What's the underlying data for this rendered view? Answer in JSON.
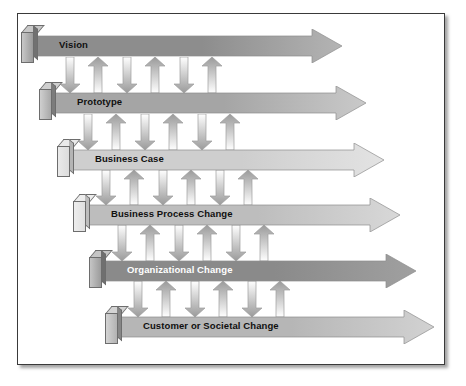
{
  "diagram": {
    "frame": {
      "border_color": "#3a3a3a",
      "background": "#ffffff"
    },
    "rows": [
      {
        "label": "Vision",
        "text_color": "#101010",
        "fill_start": "#8d8d8d",
        "fill_end": "#b4b4b4",
        "cap_front": "#9a9a9a",
        "cap_top": "#c8c8c8",
        "cap_side": "#717171",
        "x": 14,
        "y": 15,
        "width": 310,
        "label_x": 27
      },
      {
        "label": "Prototype",
        "text_color": "#101010",
        "fill_start": "#a5a5a5",
        "fill_end": "#c9c9c9",
        "cap_front": "#a8a8a8",
        "cap_top": "#cfcfcf",
        "cap_side": "#7c7c7c",
        "x": 32,
        "y": 72,
        "width": 316,
        "label_x": 27
      },
      {
        "label": "Business Case",
        "text_color": "#101010",
        "fill_start": "#cecece",
        "fill_end": "#e3e3e3",
        "cap_front": "#dcdcdc",
        "cap_top": "#eaeaea",
        "cap_side": "#b4b4b4",
        "x": 50,
        "y": 129,
        "width": 316,
        "label_x": 27
      },
      {
        "label": "Business Process Change",
        "text_color": "#101010",
        "fill_start": "#bdbdbd",
        "fill_end": "#d8d8d8",
        "cap_front": "#e0e0e0",
        "cap_top": "#ededed",
        "cap_side": "#bdbdbd",
        "x": 66,
        "y": 184,
        "width": 316,
        "label_x": 27
      },
      {
        "label": "Organizational Change",
        "text_color": "#ffffff",
        "fill_start": "#8a8a8a",
        "fill_end": "#a0a0a0",
        "cap_front": "#9b9b9b",
        "cap_top": "#c5c5c5",
        "cap_side": "#6f6f6f",
        "x": 82,
        "y": 240,
        "width": 316,
        "label_x": 27
      },
      {
        "label": "Customer or Societal Change",
        "text_color": "#101010",
        "fill_start": "#b6b6b6",
        "fill_end": "#d2d2d2",
        "cap_front": "#b2b2b2",
        "cap_top": "#d4d4d4",
        "cap_side": "#868686",
        "x": 98,
        "y": 296,
        "width": 318,
        "label_x": 27
      }
    ],
    "connector_gaps": [
      {
        "y": 48,
        "height": 26,
        "start_x": 42,
        "pairs": 3
      },
      {
        "y": 105,
        "height": 26,
        "start_x": 60,
        "pairs": 3
      },
      {
        "y": 161,
        "height": 25,
        "start_x": 78,
        "pairs": 3
      },
      {
        "y": 216,
        "height": 26,
        "start_x": 94,
        "pairs": 3
      },
      {
        "y": 272,
        "height": 26,
        "start_x": 110,
        "pairs": 3
      }
    ],
    "connector": {
      "down_icon": "arrow-down-icon",
      "up_icon": "arrow-up-icon",
      "down_fill_start": "#ffffff",
      "down_fill_end": "#9a9a9a",
      "up_fill_start": "#9a9a9a",
      "up_fill_end": "#ffffff",
      "outline": "#9d9d9d",
      "width": 20,
      "pair_spacing": 57,
      "pair_offset": 28
    }
  }
}
